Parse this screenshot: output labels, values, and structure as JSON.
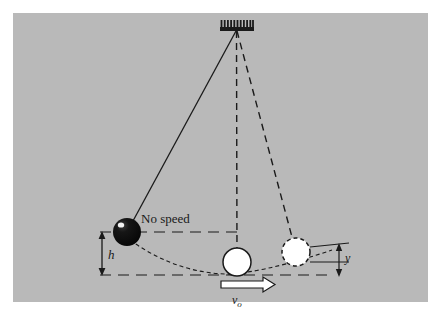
{
  "figure": {
    "panel_background_color": "#b9b9b9",
    "page_background_color": "#ffffff",
    "ink_color": "#1a1a1a",
    "ball_dark_color": "#111111",
    "ball_light_color": "#ffffff"
  },
  "labels": {
    "no_speed": "No speed",
    "height": "h",
    "velocity": "v",
    "velocity_subscript": "o",
    "drop": "y"
  },
  "elements": {
    "support": {
      "name": "hatched ceiling support",
      "bar_x1": 220,
      "bar_x2": 254,
      "bar_y": 27,
      "hatch_count": 11,
      "hatch_height": 7
    },
    "pivot": {
      "x": 236,
      "y": 30
    },
    "strings": [
      {
        "name": "string-left-solid",
        "style": "solid",
        "to_x": 127,
        "to_y": 232
      },
      {
        "name": "string-center-dashed",
        "style": "dashed",
        "to_x": 237,
        "to_y": 262
      },
      {
        "name": "string-right-dashed",
        "style": "dashed",
        "to_x": 296,
        "to_y": 252
      }
    ],
    "bobs": [
      {
        "name": "bob-released",
        "x": 127,
        "y": 232,
        "r": 14,
        "fill": "dark",
        "outline": "none"
      },
      {
        "name": "bob-lowest",
        "x": 237,
        "y": 262,
        "r": 14,
        "fill": "light",
        "outline": "solid"
      },
      {
        "name": "bob-right",
        "x": 296,
        "y": 252,
        "r": 14,
        "fill": "light",
        "outline": "dashed"
      }
    ],
    "reference_lines": [
      {
        "name": "upper-level-dashed-line",
        "y": 232,
        "x1": 100,
        "x2": 237
      },
      {
        "name": "lower-level-dashed-line",
        "y": 275,
        "x1": 100,
        "x2": 330
      }
    ],
    "dimension_h": {
      "x": 102,
      "y_top": 232,
      "y_bottom": 275
    },
    "dimension_y": {
      "x": 339,
      "y_top": 247,
      "y_bottom": 275
    },
    "velocity_arrow": {
      "from_x": 221,
      "to_x": 274,
      "y": 285,
      "direction": "right"
    },
    "trajectory": {
      "name": "swing-arc-dashed",
      "from_x": 127,
      "from_y": 238,
      "to_x": 330,
      "to_y": 268
    }
  }
}
